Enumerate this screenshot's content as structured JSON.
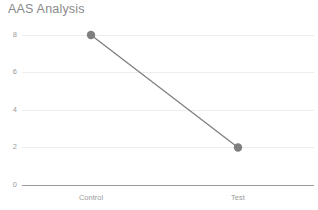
{
  "chart_data": {
    "type": "line",
    "title": "AAS Analysis",
    "xlabel": "",
    "ylabel": "",
    "categories": [
      "Control",
      "Test"
    ],
    "series": [
      {
        "name": "AAS",
        "values": [
          8,
          2
        ],
        "color": "#7f7f7f",
        "marker": "circle",
        "marker_size": 8
      }
    ],
    "ylim": [
      0,
      8
    ],
    "yticks": [
      0,
      2,
      4,
      6,
      8
    ],
    "ytick_labels": [
      "0",
      "2",
      "4",
      "6",
      "8"
    ],
    "grid": true,
    "grid_color": "#ededed",
    "axis_color": "#9a9a9a",
    "legend": false,
    "legend_position": "none",
    "background": "#ffffff",
    "title_color": "#8a8a8a",
    "tick_label_color": "#9b9b9b"
  },
  "axes": {
    "y_ticks": [
      {
        "value": 8,
        "label": "8"
      },
      {
        "value": 6,
        "label": "6"
      },
      {
        "value": 4,
        "label": "4"
      },
      {
        "value": 2,
        "label": "2"
      },
      {
        "value": 0,
        "label": "0"
      }
    ],
    "x_ticks": [
      {
        "label": "Control"
      },
      {
        "label": "Test"
      }
    ]
  },
  "points": [
    {
      "category": "Control",
      "value": 8
    },
    {
      "category": "Test",
      "value": 2
    }
  ]
}
